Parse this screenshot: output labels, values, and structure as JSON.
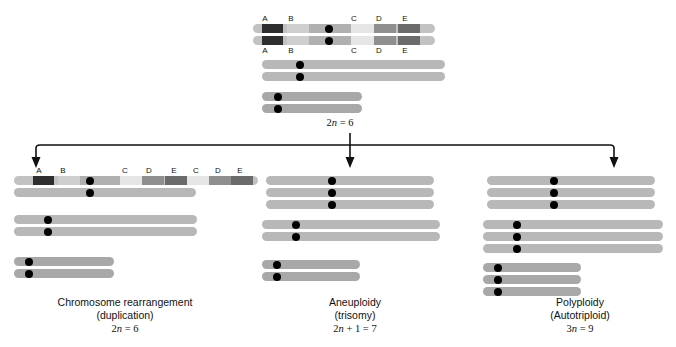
{
  "figure": {
    "type": "biology-diagram",
    "background_color": "#ffffff"
  },
  "colors": {
    "chromosome_light": "#b8b8b8",
    "chromosome_mid": "#b0b0b0",
    "chromosome_dark": "#a6a6a6",
    "band_A": "#2e2e2e",
    "band_B": "#cfcfcf",
    "band_C": "#e2e2e2",
    "band_D": "#8f8f8f",
    "band_E": "#6f6f6f",
    "centromere": "#000000",
    "arrow": "#111111",
    "text": "#111111"
  },
  "parent": {
    "ploidy_label": "2n = 6",
    "ploidy_n": "n",
    "ploidy_prefix": "2",
    "ploidy_suffix": " = 6",
    "band_labels_top": [
      "A",
      "B",
      "C",
      "D",
      "E"
    ],
    "band_labels_bottom": [
      "A",
      "B",
      "C",
      "D",
      "E"
    ],
    "chromosome_count": 6,
    "pairs": [
      {
        "name": "pair-1-banded",
        "copies": 2,
        "banded": true
      },
      {
        "name": "pair-2-long-light",
        "copies": 2,
        "banded": false
      },
      {
        "name": "pair-3-short-dark",
        "copies": 2,
        "banded": false
      }
    ]
  },
  "outcomes": [
    {
      "id": "chromosome-rearrangement",
      "caption_line1": "Chromosome rearrangement",
      "caption_line2": "(duplication)",
      "ploidy_prefix": "2",
      "ploidy_n": "n",
      "ploidy_suffix": " = 6",
      "ploidy_label": "2n = 6",
      "band_labels": [
        "A",
        "B",
        "C",
        "D",
        "E",
        "C",
        "D",
        "E"
      ],
      "chromosome_count": 6,
      "note": "top homolog carries duplicated C D E segment"
    },
    {
      "id": "aneuploidy",
      "caption_line1": "Aneuploidy",
      "caption_line2": "(trisomy)",
      "ploidy_prefix": "2",
      "ploidy_n": "n",
      "ploidy_suffix": " + 1 = 7",
      "ploidy_label": "2n + 1 = 7",
      "band_labels": [],
      "chromosome_count": 7,
      "note": "three copies of chromosome 1"
    },
    {
      "id": "polyploidy",
      "caption_line1": "Polyploidy",
      "caption_line2": "(Autotriploid)",
      "ploidy_prefix": "3",
      "ploidy_n": "n",
      "ploidy_suffix": " = 9",
      "ploidy_label": "3n = 9",
      "band_labels": [],
      "chromosome_count": 9,
      "note": "three copies of every chromosome"
    }
  ]
}
